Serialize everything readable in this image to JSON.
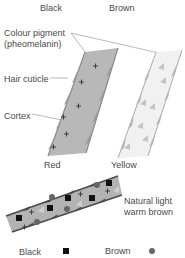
{
  "diagram": {
    "type": "hair pigment illustration",
    "top_labels": {
      "black": "Black",
      "brown": "Brown"
    },
    "annotations": {
      "colour_pigment_line1": "Colour pigment",
      "colour_pigment_line2": "(pheomelanin)",
      "hair_cuticle": "Hair cuticle",
      "cortex": "Cortex"
    },
    "strands": [
      {
        "id": "red",
        "label": "Red",
        "fill": "#b8b8b8",
        "pigment_symbol": "cross"
      },
      {
        "id": "yellow",
        "label": "Yellow",
        "fill": "#f0f0f0",
        "pigment_symbol": "triangle"
      },
      {
        "id": "natural",
        "label_line1": "Natural light",
        "label_line2": "warm brown",
        "fill": "#b3b3b3",
        "pigment_symbols": [
          "square",
          "circle",
          "cross",
          "triangle"
        ]
      }
    ],
    "legend": {
      "black": {
        "label": "Black",
        "symbol": "square",
        "color": "#111111"
      },
      "brown": {
        "label": "Brown",
        "symbol": "circle",
        "color": "#666666"
      }
    },
    "colors": {
      "cuticle_dark": "#555555",
      "cuticle_light": "#aaaaaa",
      "triangle": "#c4c4c4",
      "leader_line": "#888888"
    }
  }
}
